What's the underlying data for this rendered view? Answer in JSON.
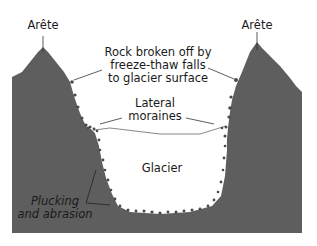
{
  "diagram": {
    "labels": {
      "arete_left": "Arête",
      "arete_right": "Arête",
      "rockfall": [
        "Rock broken off by",
        "freeze-thaw falls",
        "to glacier surface"
      ],
      "moraines": [
        "Lateral",
        "moraines"
      ],
      "glacier": "Glacier",
      "plucking": [
        "Plucking",
        "and abrasion"
      ]
    },
    "colors": {
      "rock": "#5e5e5e",
      "glacier": "#ffffff",
      "debris": "#4a4a4a",
      "line": "#333333"
    }
  }
}
